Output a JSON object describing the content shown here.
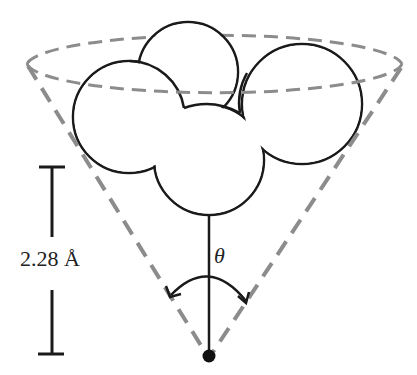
{
  "diagram": {
    "scale_bar": {
      "label": "2.28 Å"
    },
    "angle_label": "θ",
    "elements": {
      "cone": {
        "style": "dashed",
        "color": "#8c8c8c"
      },
      "molecule": {
        "spheres": 4,
        "stroke": "#1a1a1a"
      },
      "pivot_point": {
        "color": "#111111"
      }
    }
  }
}
